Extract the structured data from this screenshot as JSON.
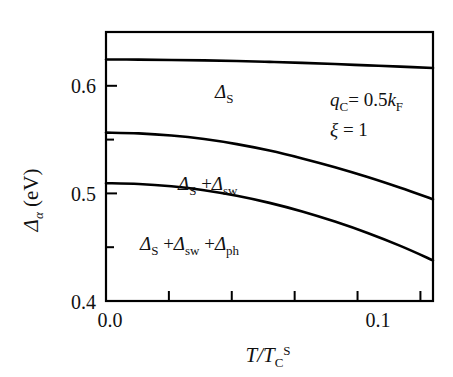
{
  "chart_data": {
    "type": "line",
    "title": "",
    "subtitle": "",
    "xlabel": "T/T_C^S",
    "ylabel": "Δ_α (eV)",
    "xlim": [
      0.0,
      0.13
    ],
    "ylim": [
      0.4,
      0.65
    ],
    "grid": false,
    "legend_position": "inline-labels",
    "xticks": [
      0.0,
      0.025,
      0.05,
      0.075,
      0.1,
      0.125
    ],
    "xticklabels": [
      "0.0",
      "",
      "",
      "",
      "0.1",
      ""
    ],
    "yticks": [
      0.4,
      0.45,
      0.5,
      0.55,
      0.6
    ],
    "yticklabels": [
      "0.4",
      "",
      "0.5",
      "",
      "0.6"
    ],
    "series": [
      {
        "name": "Δ_S",
        "label": "Δ S",
        "x": [
          0.0,
          0.013,
          0.026,
          0.039,
          0.052,
          0.065,
          0.078,
          0.091,
          0.104,
          0.117,
          0.13
        ],
        "values": [
          0.6245,
          0.6243,
          0.624,
          0.6236,
          0.623,
          0.6222,
          0.6213,
          0.6202,
          0.619,
          0.6178,
          0.6165
        ]
      },
      {
        "name": "Δ_S + Δ_sw",
        "label": "Δ S + Δ sw",
        "x": [
          0.0,
          0.013,
          0.026,
          0.039,
          0.052,
          0.065,
          0.078,
          0.091,
          0.104,
          0.117,
          0.13
        ],
        "values": [
          0.5565,
          0.5558,
          0.5538,
          0.5505,
          0.5458,
          0.5398,
          0.5325,
          0.5243,
          0.5152,
          0.5052,
          0.4945
        ]
      },
      {
        "name": "Δ_S + Δ_sw + Δ_ph",
        "label": "Δ S + Δ sw + Δ ph",
        "x": [
          0.0,
          0.013,
          0.026,
          0.039,
          0.052,
          0.065,
          0.078,
          0.091,
          0.104,
          0.117,
          0.13
        ],
        "values": [
          0.5095,
          0.5088,
          0.5066,
          0.503,
          0.4978,
          0.4912,
          0.4832,
          0.4738,
          0.4632,
          0.4512,
          0.4378
        ]
      }
    ],
    "annotations": [
      {
        "name": "qc-condition",
        "text": "q_C = 0.5 k_F"
      },
      {
        "name": "xi-condition",
        "text": "ξ = 1"
      }
    ]
  },
  "axes": {
    "y_axis_label": {
      "delta": "Δ",
      "alpha_sub": "α",
      "unit": "(eV)"
    },
    "x_axis_label": {
      "numerator": "T",
      "slash": "/",
      "denominator": "T",
      "denominator_sub": "C",
      "denominator_sup": "S"
    },
    "ytick_labels": [
      "0.6",
      "0.5",
      "0.4"
    ],
    "xtick_labels": [
      "0.0",
      "0.1"
    ]
  },
  "curve_labels": {
    "curve1": {
      "delta": "Δ",
      "sub": "S"
    },
    "curve2": {
      "delta1": "Δ",
      "sub1": "S",
      "plus": "+",
      "delta2": "Δ",
      "sub2": "sw"
    },
    "curve3": {
      "delta1": "Δ",
      "sub1": "S",
      "plus1": "+",
      "delta2": "Δ",
      "sub2": "sw",
      "plus2": "+",
      "delta3": "Δ",
      "sub3": "ph"
    }
  },
  "annotations": {
    "line1": {
      "q": "q",
      "q_sub": "C",
      "eq": "= 0.5",
      "k": "k",
      "k_sub": "F"
    },
    "line2": {
      "xi": "ξ",
      "eq": "= 1"
    }
  },
  "colors": {
    "line": "#000000",
    "axis": "#000000",
    "background": "#ffffff",
    "text": "#111111"
  }
}
